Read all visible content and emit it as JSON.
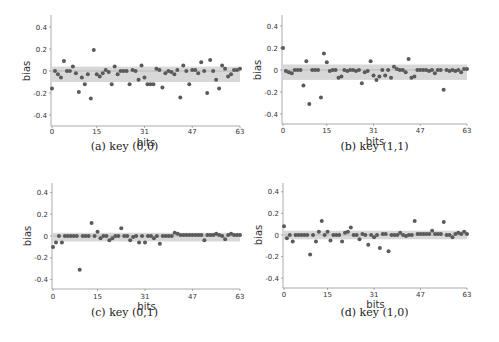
{
  "chart_data": [
    {
      "type": "scatter",
      "title": "(a) key (0,0)",
      "xlabel": "bits",
      "ylabel": "bias",
      "xticks": [
        0,
        15,
        31,
        47,
        63
      ],
      "yticks": [
        -0.4,
        -0.2,
        0,
        0.2,
        0.4
      ],
      "ytick_labels": [
        "-0.4",
        "-0.2",
        "0",
        "0.2",
        "0.4"
      ],
      "xlim": [
        0,
        63
      ],
      "ylim": [
        -0.5,
        0.5
      ],
      "band": [
        -0.1,
        0.04
      ],
      "x": [
        0,
        1,
        2,
        3,
        4,
        5,
        6,
        7,
        8,
        9,
        10,
        11,
        12,
        13,
        14,
        15,
        16,
        17,
        18,
        19,
        20,
        21,
        22,
        23,
        24,
        25,
        26,
        27,
        28,
        29,
        30,
        31,
        32,
        33,
        34,
        35,
        36,
        37,
        38,
        39,
        40,
        41,
        42,
        43,
        44,
        45,
        46,
        47,
        48,
        49,
        50,
        51,
        52,
        53,
        54,
        55,
        56,
        57,
        58,
        59,
        60,
        61,
        62,
        63
      ],
      "values": [
        -0.16,
        0.0,
        -0.03,
        -0.06,
        0.09,
        0.0,
        0.0,
        0.04,
        -0.02,
        -0.19,
        -0.06,
        -0.12,
        -0.03,
        -0.25,
        0.19,
        -0.03,
        -0.05,
        -0.02,
        0.01,
        -0.01,
        -0.12,
        0.04,
        -0.03,
        0.0,
        0.0,
        0.0,
        -0.12,
        0.01,
        0.0,
        -0.08,
        0.05,
        -0.06,
        -0.12,
        -0.12,
        -0.12,
        0.02,
        0.01,
        -0.15,
        -0.02,
        0.0,
        -0.01,
        -0.03,
        0.01,
        -0.24,
        0.05,
        0.0,
        -0.12,
        0.01,
        0.01,
        -0.02,
        0.08,
        0.0,
        -0.2,
        0.1,
        0.0,
        -0.08,
        -0.16,
        0.05,
        0.02,
        -0.05,
        -0.03,
        0.01,
        0.01,
        0.02
      ]
    },
    {
      "type": "scatter",
      "title": "(b) key (1,1)",
      "xlabel": "bits",
      "ylabel": "bias",
      "xticks": [
        0,
        15,
        31,
        47,
        63
      ],
      "yticks": [
        -0.4,
        -0.2,
        0,
        0.2,
        0.4
      ],
      "ytick_labels": [
        "-0.4",
        "-0.2",
        "0",
        "0.2",
        "0.4"
      ],
      "xlim": [
        0,
        63
      ],
      "ylim": [
        -0.5,
        0.5
      ],
      "band": [
        -0.09,
        0.05
      ],
      "x": [
        0,
        1,
        2,
        3,
        4,
        5,
        6,
        7,
        8,
        9,
        10,
        11,
        12,
        13,
        14,
        15,
        16,
        17,
        18,
        19,
        20,
        21,
        22,
        23,
        24,
        25,
        26,
        27,
        28,
        29,
        30,
        31,
        32,
        33,
        34,
        35,
        36,
        37,
        38,
        39,
        40,
        41,
        42,
        43,
        44,
        45,
        46,
        47,
        48,
        49,
        50,
        51,
        52,
        53,
        54,
        55,
        56,
        57,
        58,
        59,
        60,
        61,
        62,
        63
      ],
      "values": [
        0.2,
        -0.01,
        -0.02,
        -0.03,
        0.0,
        0.0,
        0.0,
        -0.14,
        0.08,
        -0.31,
        0.0,
        0.0,
        0.0,
        -0.25,
        0.15,
        0.07,
        -0.01,
        0.0,
        0.0,
        -0.07,
        -0.06,
        0.0,
        -0.01,
        0.0,
        0.0,
        -0.01,
        0.0,
        -0.12,
        -0.02,
        -0.01,
        0.08,
        -0.05,
        -0.09,
        -0.06,
        0.0,
        -0.05,
        0.0,
        -0.07,
        0.03,
        0.01,
        0.0,
        0.0,
        -0.02,
        0.1,
        -0.07,
        -0.06,
        0.0,
        0.0,
        0.0,
        0.0,
        -0.01,
        0.0,
        -0.03,
        0.0,
        0.0,
        -0.18,
        0.0,
        -0.01,
        0.0,
        -0.01,
        0.0,
        -0.02,
        0.01,
        0.01
      ]
    },
    {
      "type": "scatter",
      "title": "(c) key (0,1)",
      "xlabel": "bits",
      "ylabel": "bias",
      "xticks": [
        0,
        15,
        31,
        47,
        63
      ],
      "yticks": [
        -0.4,
        -0.2,
        0,
        0.2,
        0.4
      ],
      "ytick_labels": [
        "-0.4",
        "-0.2",
        "0",
        "0.2",
        "0.4"
      ],
      "xlim": [
        0,
        63
      ],
      "ylim": [
        -0.5,
        0.5
      ],
      "band": [
        -0.05,
        0.03
      ],
      "x": [
        0,
        1,
        2,
        3,
        4,
        5,
        6,
        7,
        8,
        9,
        10,
        11,
        12,
        13,
        14,
        15,
        16,
        17,
        18,
        19,
        20,
        21,
        22,
        23,
        24,
        25,
        26,
        27,
        28,
        29,
        30,
        31,
        32,
        33,
        34,
        35,
        36,
        37,
        38,
        39,
        40,
        41,
        42,
        43,
        44,
        45,
        46,
        47,
        48,
        49,
        50,
        51,
        52,
        53,
        54,
        55,
        56,
        57,
        58,
        59,
        60,
        61,
        62,
        63
      ],
      "values": [
        -0.1,
        -0.06,
        0.0,
        -0.06,
        0.0,
        0.0,
        0.0,
        0.0,
        0.0,
        -0.31,
        0.0,
        0.0,
        0.0,
        0.12,
        0.0,
        0.04,
        -0.02,
        0.0,
        0.0,
        -0.04,
        -0.02,
        0.0,
        0.0,
        0.07,
        0.0,
        0.0,
        -0.04,
        -0.01,
        0.0,
        -0.06,
        0.0,
        -0.06,
        0.0,
        0.0,
        -0.02,
        0.0,
        -0.07,
        0.0,
        0.0,
        0.0,
        0.0,
        0.03,
        0.02,
        0.01,
        0.01,
        0.01,
        0.01,
        0.01,
        0.01,
        0.01,
        0.01,
        -0.04,
        0.01,
        0.01,
        0.01,
        0.02,
        0.01,
        0.0,
        -0.03,
        0.01,
        0.02,
        0.01,
        0.01,
        0.01
      ]
    },
    {
      "type": "scatter",
      "title": "(d) key (1,0)",
      "xlabel": "bits",
      "ylabel": "bias",
      "xticks": [
        0,
        15,
        31,
        47,
        63
      ],
      "yticks": [
        -0.4,
        -0.2,
        0,
        0.2,
        0.4
      ],
      "ytick_labels": [
        "-0.4",
        "-0.2",
        "0",
        "0.2",
        "0.4"
      ],
      "xlim": [
        0,
        63
      ],
      "ylim": [
        -0.5,
        0.5
      ],
      "band": [
        -0.04,
        0.04
      ],
      "x": [
        0,
        1,
        2,
        3,
        4,
        5,
        6,
        7,
        8,
        9,
        10,
        11,
        12,
        13,
        14,
        15,
        16,
        17,
        18,
        19,
        20,
        21,
        22,
        23,
        24,
        25,
        26,
        27,
        28,
        29,
        30,
        31,
        32,
        33,
        34,
        35,
        36,
        37,
        38,
        39,
        40,
        41,
        42,
        43,
        44,
        45,
        46,
        47,
        48,
        49,
        50,
        51,
        52,
        53,
        54,
        55,
        56,
        57,
        58,
        59,
        60,
        61,
        62,
        63
      ],
      "values": [
        0.08,
        -0.03,
        0.0,
        -0.06,
        0.0,
        0.0,
        0.0,
        0.0,
        0.0,
        -0.18,
        0.0,
        -0.06,
        0.03,
        0.13,
        0.0,
        0.03,
        -0.05,
        0.0,
        0.0,
        0.0,
        -0.06,
        0.02,
        0.03,
        0.07,
        0.0,
        0.0,
        -0.04,
        0.01,
        0.0,
        -0.09,
        0.0,
        -0.02,
        0.0,
        -0.12,
        0.01,
        0.01,
        -0.15,
        0.0,
        0.0,
        0.0,
        0.02,
        0.0,
        -0.01,
        0.0,
        0.0,
        0.13,
        0.01,
        0.01,
        0.01,
        0.01,
        0.01,
        0.04,
        0.01,
        0.01,
        0.01,
        0.12,
        0.0,
        0.0,
        -0.02,
        0.01,
        0.02,
        0.01,
        0.03,
        0.01
      ]
    }
  ],
  "captions": {
    "a": "(a) key (0,0)",
    "b": "(b) key (1,1)",
    "c": "(c) key (0,1)",
    "d": "(d) key (1,0)"
  },
  "axis": {
    "xlabel": "bits",
    "ylabel": "bias"
  },
  "colors": {
    "points": "#5a5a5a",
    "band": "#d8d8d8",
    "axis": "#888888",
    "text": "#333333"
  }
}
